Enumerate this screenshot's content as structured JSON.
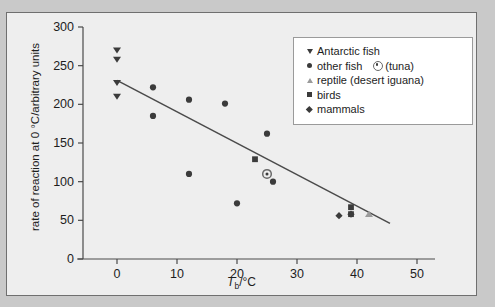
{
  "figure": {
    "background": "#eeeeee",
    "page_background": "#c9c9c9",
    "border_color": "#6f6f6f"
  },
  "legend": {
    "position": "top-right",
    "entries": [
      {
        "marker": "triangle-down-icon",
        "label": "Antarctic fish",
        "color": "#3b3b3b"
      },
      {
        "marker": "circle-icon",
        "label": "other fish",
        "color": "#3b3b3b",
        "extra_marker": "tuna-circle-icon",
        "extra_label": "(tuna)"
      },
      {
        "marker": "triangle-up-icon",
        "label": "reptile (desert iguana)",
        "color": "#9b9b9b"
      },
      {
        "marker": "square-icon",
        "label": "birds",
        "color": "#3b3b3b"
      },
      {
        "marker": "diamond-icon",
        "label": "mammals",
        "color": "#3b3b3b"
      }
    ]
  },
  "chart_data": {
    "type": "scatter",
    "title": "",
    "xlabel": "Tb/°C",
    "xlabel_parts": {
      "italic": "T",
      "sub": "b",
      "rest": "/°C"
    },
    "ylabel": "rate of reaction at 0 °C/arbitrary units",
    "xlim": [
      -3,
      52
    ],
    "ylim": [
      0,
      300
    ],
    "xticks": [
      0,
      10,
      20,
      30,
      40,
      50
    ],
    "xticklabels": [
      "0",
      "10",
      "20",
      "30",
      "40",
      "50"
    ],
    "yticks": [
      0,
      50,
      100,
      150,
      200,
      250,
      300
    ],
    "yticklabels": [
      "0",
      "50",
      "100",
      "150",
      "200",
      "250",
      "300"
    ],
    "grid": false,
    "axis_color": "#4a4a4a",
    "series": [
      {
        "name": "Antarctic fish",
        "marker": "triangle-down",
        "color": "#3b3b3b",
        "points": [
          {
            "x": 0,
            "y": 270
          },
          {
            "x": 0,
            "y": 258
          },
          {
            "x": 0,
            "y": 228
          },
          {
            "x": 0,
            "y": 210
          }
        ]
      },
      {
        "name": "other fish",
        "marker": "circle",
        "color": "#3b3b3b",
        "points": [
          {
            "x": 6,
            "y": 222
          },
          {
            "x": 6,
            "y": 185
          },
          {
            "x": 12,
            "y": 206
          },
          {
            "x": 12,
            "y": 110
          },
          {
            "x": 18,
            "y": 201
          },
          {
            "x": 20,
            "y": 72
          },
          {
            "x": 25,
            "y": 162
          },
          {
            "x": 26,
            "y": 100
          }
        ]
      },
      {
        "name": "tuna",
        "marker": "tuna-circle",
        "color": "#6a6a6a",
        "points": [
          {
            "x": 25,
            "y": 110
          }
        ]
      },
      {
        "name": "reptile (desert iguana)",
        "marker": "triangle-up",
        "color": "#9b9b9b",
        "points": [
          {
            "x": 42,
            "y": 58
          }
        ]
      },
      {
        "name": "birds",
        "marker": "square",
        "color": "#3b3b3b",
        "points": [
          {
            "x": 23,
            "y": 129
          },
          {
            "x": 39,
            "y": 67
          },
          {
            "x": 39,
            "y": 58
          }
        ]
      },
      {
        "name": "mammals",
        "marker": "diamond",
        "color": "#3b3b3b",
        "points": [
          {
            "x": 37,
            "y": 56
          },
          {
            "x": 39,
            "y": 58
          }
        ]
      }
    ],
    "trendline": {
      "type": "line",
      "color": "#4a4a4a",
      "x_start": 0,
      "y_start": 231,
      "x_end": 45.5,
      "y_end": 46
    }
  }
}
